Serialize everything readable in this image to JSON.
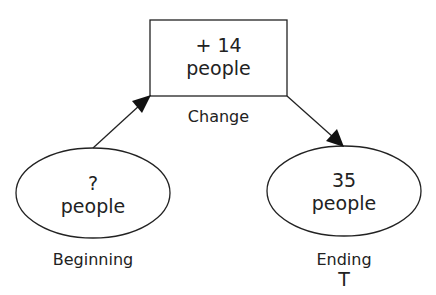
{
  "diagram": {
    "change_box": {
      "line1": "+ 14",
      "line2": "people",
      "caption": "Change"
    },
    "beginning": {
      "line1": "?",
      "line2": "people",
      "caption": "Beginning"
    },
    "ending": {
      "line1": "35",
      "line2": "people",
      "caption": "Ending"
    },
    "cursor_glyph": "T",
    "stroke_color": "#222222"
  }
}
